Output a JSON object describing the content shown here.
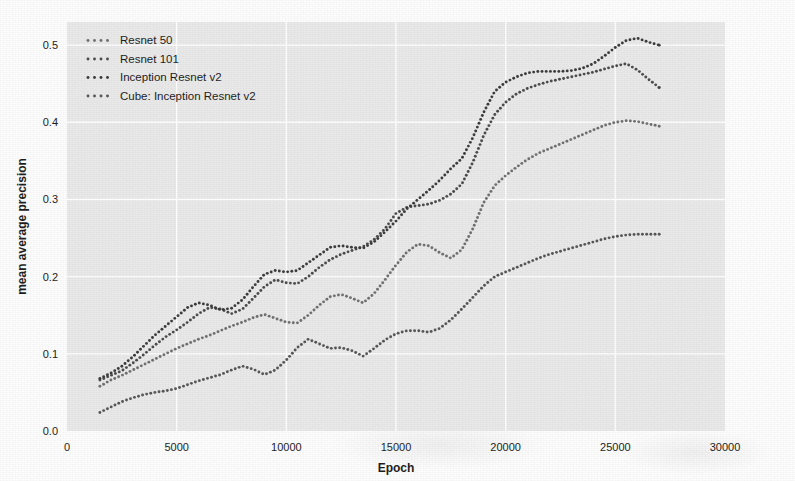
{
  "chart_data": {
    "type": "line",
    "title": "",
    "xlabel": "Epoch",
    "ylabel": "mean average precision",
    "xlim": [
      0,
      30000
    ],
    "ylim": [
      0.0,
      0.53
    ],
    "xticks": [
      0,
      5000,
      10000,
      15000,
      20000,
      25000,
      30000
    ],
    "xticklabels": [
      "0",
      "5000",
      "10000",
      "15000",
      "20000",
      "25000",
      "30000"
    ],
    "yticks": [
      0.0,
      0.1,
      0.2,
      0.3,
      0.4,
      0.5
    ],
    "yticklabels": [
      "0.0",
      "0.1",
      "0.2",
      "0.3",
      "0.4",
      "0.5"
    ],
    "grid": true,
    "grid_color": "#ffffff",
    "plot_background": "#e9e9e9",
    "figure_background": "#fdfdfd",
    "marker": "dotted",
    "legend_position": "top-left",
    "series": [
      {
        "name": "Resnet 50",
        "color": "#6f6f6f",
        "x": [
          1500,
          2000,
          2500,
          3000,
          3500,
          4000,
          4500,
          5000,
          5500,
          6000,
          6500,
          7000,
          7500,
          8000,
          8500,
          9000,
          9500,
          10000,
          10500,
          11000,
          11500,
          12000,
          12500,
          13000,
          13500,
          14000,
          14500,
          15000,
          15500,
          16000,
          16500,
          17000,
          17500,
          18000,
          18500,
          19000,
          19500,
          20000,
          20500,
          21000,
          21500,
          22000,
          22500,
          23000,
          23500,
          24000,
          24500,
          25000,
          25500,
          26000,
          26500,
          27000
        ],
        "y": [
          0.058,
          0.066,
          0.072,
          0.079,
          0.086,
          0.093,
          0.1,
          0.107,
          0.113,
          0.119,
          0.124,
          0.13,
          0.136,
          0.141,
          0.147,
          0.151,
          0.146,
          0.141,
          0.14,
          0.15,
          0.163,
          0.174,
          0.177,
          0.172,
          0.166,
          0.178,
          0.196,
          0.215,
          0.232,
          0.242,
          0.24,
          0.231,
          0.224,
          0.235,
          0.262,
          0.296,
          0.318,
          0.331,
          0.342,
          0.352,
          0.36,
          0.366,
          0.372,
          0.378,
          0.384,
          0.39,
          0.396,
          0.4,
          0.402,
          0.401,
          0.398,
          0.395
        ]
      },
      {
        "name": "Resnet 101",
        "color": "#4a4a4a",
        "x": [
          1500,
          2000,
          2500,
          3000,
          3500,
          4000,
          4500,
          5000,
          5500,
          6000,
          6500,
          7000,
          7500,
          8000,
          8500,
          9000,
          9500,
          10000,
          10500,
          11000,
          11500,
          12000,
          12500,
          13000,
          13500,
          14000,
          14500,
          15000,
          15500,
          16000,
          16500,
          17000,
          17500,
          18000,
          18500,
          19000,
          19500,
          20000,
          20500,
          21000,
          21500,
          22000,
          22500,
          23000,
          23500,
          24000,
          24500,
          25000,
          25500,
          26000,
          26500,
          27000
        ],
        "y": [
          0.066,
          0.072,
          0.078,
          0.088,
          0.099,
          0.111,
          0.122,
          0.131,
          0.141,
          0.152,
          0.16,
          0.158,
          0.152,
          0.158,
          0.172,
          0.187,
          0.196,
          0.192,
          0.191,
          0.2,
          0.212,
          0.222,
          0.229,
          0.234,
          0.239,
          0.248,
          0.262,
          0.282,
          0.29,
          0.292,
          0.294,
          0.299,
          0.307,
          0.32,
          0.348,
          0.383,
          0.41,
          0.426,
          0.437,
          0.444,
          0.449,
          0.453,
          0.456,
          0.459,
          0.462,
          0.465,
          0.469,
          0.473,
          0.476,
          0.468,
          0.456,
          0.445
        ]
      },
      {
        "name": "Inception Resnet v2",
        "color": "#3a3a3a",
        "x": [
          1500,
          2000,
          2500,
          3000,
          3500,
          4000,
          4500,
          5000,
          5500,
          6000,
          6500,
          7000,
          7500,
          8000,
          8500,
          9000,
          9500,
          10000,
          10500,
          11000,
          11500,
          12000,
          12500,
          13000,
          13500,
          14000,
          14500,
          15000,
          15500,
          16000,
          16500,
          17000,
          17500,
          18000,
          18500,
          19000,
          19500,
          20000,
          20500,
          21000,
          21500,
          22000,
          22500,
          23000,
          23500,
          24000,
          24500,
          25000,
          25500,
          26000,
          26500,
          27000
        ],
        "y": [
          0.068,
          0.075,
          0.084,
          0.096,
          0.11,
          0.124,
          0.136,
          0.148,
          0.16,
          0.166,
          0.163,
          0.157,
          0.159,
          0.17,
          0.187,
          0.203,
          0.208,
          0.206,
          0.208,
          0.218,
          0.228,
          0.238,
          0.24,
          0.238,
          0.237,
          0.245,
          0.258,
          0.272,
          0.288,
          0.3,
          0.312,
          0.325,
          0.34,
          0.353,
          0.38,
          0.413,
          0.44,
          0.452,
          0.459,
          0.464,
          0.466,
          0.466,
          0.466,
          0.467,
          0.47,
          0.476,
          0.486,
          0.497,
          0.506,
          0.509,
          0.504,
          0.5
        ]
      },
      {
        "name": "Cube: Inception Resnet v2",
        "color": "#555555",
        "x": [
          1500,
          2000,
          2500,
          3000,
          3500,
          4000,
          4500,
          5000,
          5500,
          6000,
          6500,
          7000,
          7500,
          8000,
          8500,
          9000,
          9500,
          10000,
          10500,
          11000,
          11500,
          12000,
          12500,
          13000,
          13500,
          14000,
          14500,
          15000,
          15500,
          16000,
          16500,
          17000,
          17500,
          18000,
          18500,
          19000,
          19500,
          20000,
          20500,
          21000,
          21500,
          22000,
          22500,
          23000,
          23500,
          24000,
          24500,
          25000,
          25500,
          26000,
          26500,
          27000
        ],
        "y": [
          0.024,
          0.031,
          0.038,
          0.043,
          0.047,
          0.05,
          0.052,
          0.055,
          0.06,
          0.065,
          0.069,
          0.073,
          0.079,
          0.084,
          0.08,
          0.073,
          0.079,
          0.092,
          0.108,
          0.119,
          0.113,
          0.107,
          0.108,
          0.104,
          0.097,
          0.107,
          0.118,
          0.126,
          0.13,
          0.13,
          0.128,
          0.133,
          0.144,
          0.158,
          0.173,
          0.188,
          0.2,
          0.206,
          0.212,
          0.218,
          0.224,
          0.229,
          0.233,
          0.237,
          0.241,
          0.245,
          0.249,
          0.252,
          0.254,
          0.255,
          0.255,
          0.255
        ]
      }
    ]
  }
}
